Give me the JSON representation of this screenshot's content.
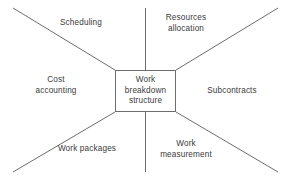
{
  "diagram": {
    "center": {
      "label": "Work\nbreakdown\nstructure"
    },
    "regions": [
      {
        "id": "scheduling",
        "label": "Scheduling"
      },
      {
        "id": "resources",
        "label": "Resources\nallocation"
      },
      {
        "id": "cost",
        "label": "Cost\naccounting"
      },
      {
        "id": "subcontracts",
        "label": "Subcontracts"
      },
      {
        "id": "packages",
        "label": "Work packages"
      },
      {
        "id": "measurement",
        "label": "Work\nmeasurement"
      }
    ],
    "colors": {
      "line": "#6d6d6d",
      "text": "#3a3a3a",
      "background": "#ffffff"
    }
  }
}
